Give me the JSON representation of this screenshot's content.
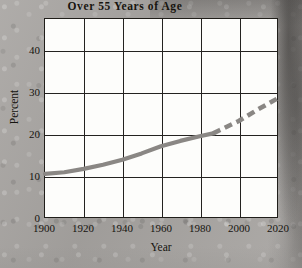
{
  "chart_data": {
    "type": "line",
    "title": "Over 55 Years of Age",
    "xlabel": "Year",
    "ylabel": "Percent",
    "xlim": [
      1900,
      2020
    ],
    "ylim": [
      0,
      47.5
    ],
    "grid": true,
    "legend": null,
    "x_ticks": [
      1900,
      1920,
      1940,
      1960,
      1980,
      2000,
      2020
    ],
    "y_ticks": [
      0,
      10,
      20,
      30,
      40
    ],
    "series": [
      {
        "name": "Percent over 55 years of age",
        "color": "#8a8784",
        "style": "solid-then-dashed",
        "dash_begins_at": 1987,
        "x": [
          1900,
          1910,
          1920,
          1930,
          1940,
          1950,
          1960,
          1970,
          1980,
          1987,
          1990,
          2000,
          2010,
          2020
        ],
        "values": [
          10.4,
          10.8,
          11.6,
          12.6,
          13.8,
          15.3,
          17.0,
          18.3,
          19.4,
          20.1,
          20.8,
          23.0,
          25.8,
          28.4
        ]
      }
    ]
  },
  "axes": {
    "y_tick_labels": [
      "40",
      "30",
      "20",
      "10",
      "0"
    ],
    "x_tick_labels": [
      "1900",
      "1920",
      "1940",
      "1960",
      "1980",
      "2000",
      "2020"
    ]
  }
}
